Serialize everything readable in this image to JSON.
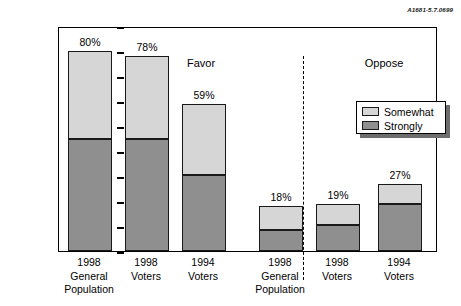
{
  "corner_code": "A1681-5.7.0699",
  "legend": {
    "position": "upper-right",
    "entries": [
      {
        "label": "Somewhat",
        "color": "#d6d6d6"
      },
      {
        "label": "Strongly",
        "color": "#8f8f8f"
      }
    ]
  },
  "groups": [
    {
      "name": "Favor"
    },
    {
      "name": "Oppose"
    }
  ],
  "chart_data": {
    "type": "bar",
    "title": "",
    "subtitle": "",
    "xlabel": "",
    "ylabel": "Percentage",
    "ylim": [
      0,
      90
    ],
    "yticks": [
      0,
      10,
      20,
      30,
      40,
      50,
      60,
      70,
      80,
      90
    ],
    "ytick_labels": [
      "0",
      "10",
      "20",
      "30",
      "40",
      "50",
      "60",
      "70",
      "80",
      "90"
    ],
    "grid": false,
    "stacked": true,
    "legend_position": "upper right",
    "group_labels": [
      "Favor",
      "Oppose"
    ],
    "group_divider": true,
    "categories": [
      "1998 General Population",
      "1998 Voters",
      "1994 Voters",
      "1998 General Population",
      "1998 Voters",
      "1994 Voters"
    ],
    "category_lines": [
      [
        "1998",
        "General",
        "Population"
      ],
      [
        "1998",
        "Voters"
      ],
      [
        "1994",
        "Voters"
      ],
      [
        "1998",
        "General",
        "Population"
      ],
      [
        "1998",
        "Voters"
      ],
      [
        "1994",
        "Voters"
      ]
    ],
    "series": [
      {
        "name": "Strongly",
        "color": "#8f8f8f",
        "values": [
          45,
          45,
          30.5,
          8.5,
          10.5,
          19
        ]
      },
      {
        "name": "Somewhat",
        "color": "#d6d6d6",
        "values": [
          35,
          33,
          28.5,
          9.5,
          8.5,
          8
        ]
      }
    ],
    "totals": [
      80,
      78,
      59,
      18,
      19,
      27
    ],
    "data_labels": [
      "80%",
      "78%",
      "59%",
      "18%",
      "19%",
      "27%"
    ],
    "group_assignment": [
      "Favor",
      "Favor",
      "Favor",
      "Oppose",
      "Oppose",
      "Oppose"
    ]
  }
}
